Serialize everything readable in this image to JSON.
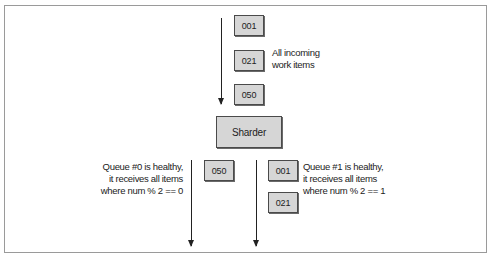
{
  "diagram": {
    "incoming": {
      "items": [
        "001",
        "021",
        "050"
      ],
      "label_lines": [
        "All incoming",
        "work items"
      ]
    },
    "sharder": {
      "label": "Sharder"
    },
    "queues": [
      {
        "name": "Queue #0",
        "items": [
          "050"
        ],
        "label_lines": [
          "Queue #0 is healthy,",
          "it receives all items",
          "where num % 2 == 0"
        ]
      },
      {
        "name": "Queue #1",
        "items": [
          "001",
          "021"
        ],
        "label_lines": [
          "Queue #1 is healthy,",
          "it receives all items",
          "where num % 2 == 1"
        ]
      }
    ],
    "colors": {
      "box_fill": "#d6d6d6",
      "box_border": "#4a4a4a",
      "arrow": "#222222",
      "frame_border": "#9a9a9a"
    }
  }
}
